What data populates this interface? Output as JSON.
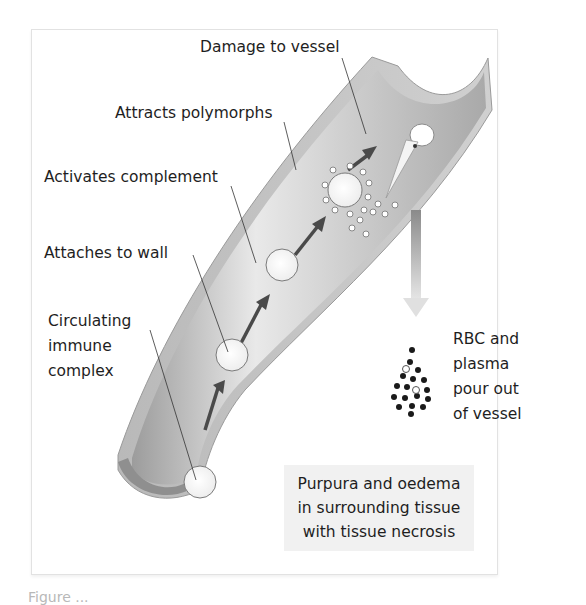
{
  "diagram": {
    "labels": {
      "damage": "Damage to vessel",
      "polymorphs": "Attracts polymorphs",
      "complement": "Activates complement",
      "attaches": "Attaches to wall",
      "circulating_1": "Circulating",
      "circulating_2": "immune",
      "circulating_3": "complex",
      "rbc_1": "RBC and",
      "rbc_2": "plasma",
      "rbc_3": "pour out",
      "rbc_4": "of vessel"
    },
    "outcome_box": {
      "line1": "Purpura and oedema",
      "line2": "in surrounding tissue",
      "line3": "with tissue necrosis"
    },
    "caption": "Figure ..."
  },
  "colors": {
    "vessel_wall": "#bdbdbd",
    "vessel_lumen": "#d6d6d6",
    "arrow": "#4a4a4a",
    "rbc_dark": "#1a1a1a",
    "box_bg": "#f1f1f1"
  }
}
